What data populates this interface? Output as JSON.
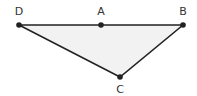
{
  "diagram": {
    "type": "geometry-figure",
    "fill_color": "#f2f2f2",
    "stroke_color": "#222222",
    "points": [
      {
        "id": "D",
        "label": "D",
        "x": 19,
        "y": 25,
        "label_x": 19,
        "label_y": 15
      },
      {
        "id": "A",
        "label": "A",
        "x": 101,
        "y": 25,
        "label_x": 101,
        "label_y": 15
      },
      {
        "id": "B",
        "label": "B",
        "x": 183,
        "y": 25,
        "label_x": 183,
        "label_y": 15
      },
      {
        "id": "C",
        "label": "C",
        "x": 120,
        "y": 77,
        "label_x": 120,
        "label_y": 93
      }
    ],
    "polygon": [
      "D",
      "B",
      "C"
    ],
    "segments": [
      [
        "D",
        "A"
      ],
      [
        "A",
        "B"
      ],
      [
        "B",
        "C"
      ],
      [
        "C",
        "D"
      ]
    ]
  }
}
